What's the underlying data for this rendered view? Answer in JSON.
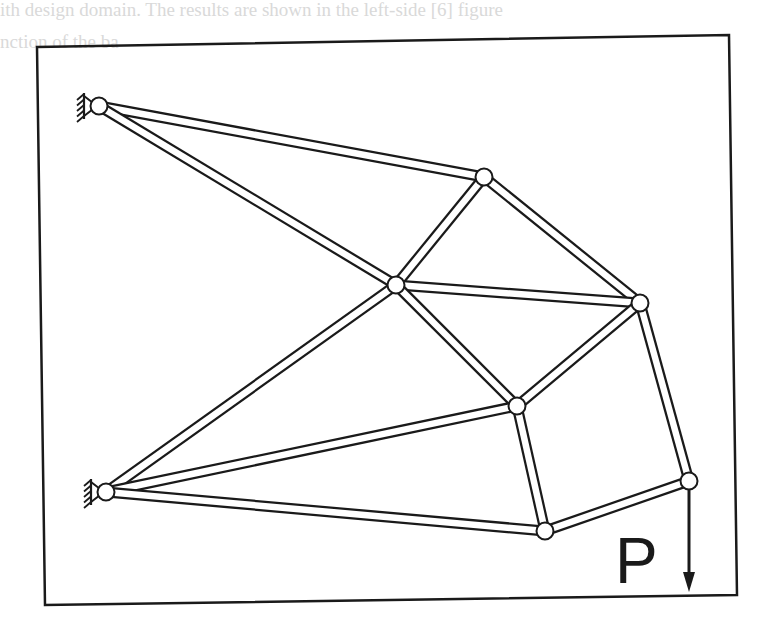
{
  "figure": {
    "load_label": "P",
    "colors": {
      "line": "#1a1a1a",
      "background": "#ffffff",
      "bleed_text": "#d9d9d9"
    },
    "frame": {
      "tl": [
        37,
        47
      ],
      "tr": [
        729,
        35
      ],
      "br": [
        737,
        595
      ],
      "bl": [
        45,
        605
      ]
    },
    "nodes": [
      {
        "id": "A",
        "x": 99,
        "y": 106,
        "support": "pin-wall"
      },
      {
        "id": "B",
        "x": 106,
        "y": 492,
        "support": "pin-wall"
      },
      {
        "id": "C",
        "x": 484,
        "y": 177
      },
      {
        "id": "D",
        "x": 396,
        "y": 285
      },
      {
        "id": "E",
        "x": 640,
        "y": 303
      },
      {
        "id": "F",
        "x": 517,
        "y": 406
      },
      {
        "id": "G",
        "x": 689,
        "y": 481,
        "load": "P"
      },
      {
        "id": "H",
        "x": 545,
        "y": 531
      }
    ],
    "members": [
      [
        "A",
        "C"
      ],
      [
        "A",
        "D"
      ],
      [
        "C",
        "D"
      ],
      [
        "C",
        "E"
      ],
      [
        "D",
        "E"
      ],
      [
        "B",
        "D"
      ],
      [
        "D",
        "F"
      ],
      [
        "E",
        "F"
      ],
      [
        "E",
        "G"
      ],
      [
        "B",
        "F"
      ],
      [
        "B",
        "H"
      ],
      [
        "F",
        "H"
      ],
      [
        "H",
        "G"
      ]
    ],
    "load": {
      "node": "G",
      "direction": "down",
      "arrow_end": [
        689,
        592
      ]
    }
  }
}
